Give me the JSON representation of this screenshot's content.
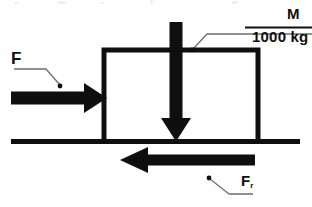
{
  "diagram": {
    "background_color": "#ffffff",
    "stroke_color": "#100f0f",
    "leader_color": "#6e6e72",
    "labels": {
      "applied_force": "F",
      "mass_symbol": "M",
      "mass_value": "1000 kg",
      "friction_force": "F",
      "friction_subscript": "r"
    },
    "elements": {
      "block": "open-bottom-rectangle",
      "ground": "horizontal-ground-line",
      "applied_force_arrow": "arrow-right",
      "weight_arrow": "arrow-down",
      "friction_arrow": "arrow-left",
      "mass_underline": "horizontal-rule",
      "leader_lines": 3,
      "leader_dots": 3
    },
    "geometry": {
      "block_left": 104,
      "block_right": 258,
      "block_top": 50,
      "ground_y": 141,
      "applied_arrow_y": 98,
      "weight_arrow_x": 176,
      "friction_arrow_y": 160
    },
    "artifact_top_text": ""
  }
}
